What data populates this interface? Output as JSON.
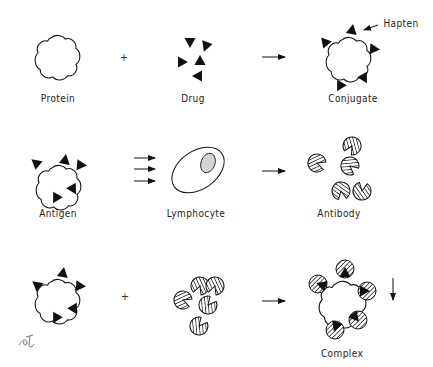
{
  "diagram": {
    "type": "immunology-schematic",
    "rows": [
      {
        "items": [
          {
            "id": "protein",
            "label": "Protein"
          },
          {
            "id": "plus",
            "symbol": "+"
          },
          {
            "id": "drug",
            "label": "Drug"
          },
          {
            "id": "arrow",
            "symbol": "→"
          },
          {
            "id": "conjugate",
            "label": "Conjugate",
            "annotation": "Hapten"
          }
        ]
      },
      {
        "items": [
          {
            "id": "antigen",
            "label": "Antigen"
          },
          {
            "id": "stimulus-arrows",
            "symbol": "⇉"
          },
          {
            "id": "lymphocyte",
            "label": "Lymphocyte"
          },
          {
            "id": "arrow",
            "symbol": "→"
          },
          {
            "id": "antibody",
            "label": "Antibody"
          }
        ]
      },
      {
        "items": [
          {
            "id": "antigen"
          },
          {
            "id": "plus",
            "symbol": "+"
          },
          {
            "id": "antibodies"
          },
          {
            "id": "arrow",
            "symbol": "→"
          },
          {
            "id": "complex",
            "label": "Complex"
          },
          {
            "id": "precipitate-arrow",
            "symbol": "↓"
          }
        ]
      }
    ],
    "colors": {
      "ink": "#111111",
      "paper": "#ffffff"
    }
  },
  "labels": {
    "protein": "Protein",
    "drug": "Drug",
    "conjugate": "Conjugate",
    "hapten": "Hapten",
    "antigen": "Antigen",
    "lymphocyte": "Lymphocyte",
    "antibody": "Antibody",
    "complex": "Complex",
    "plus": "+"
  }
}
